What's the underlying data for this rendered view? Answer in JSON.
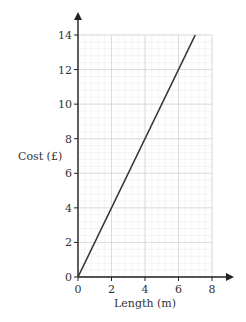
{
  "chart_data": {
    "type": "line",
    "title": "",
    "xlabel": "Length (m)",
    "ylabel": "Cost (£)",
    "xlim": [
      0,
      8
    ],
    "ylim": [
      0,
      14
    ],
    "x_ticks": [
      0,
      2,
      4,
      6,
      8
    ],
    "y_ticks": [
      0,
      2,
      4,
      6,
      8,
      10,
      12,
      14
    ],
    "grid": true,
    "minor_grid_step": 0.4,
    "legend": null,
    "series": [
      {
        "name": "Cost",
        "x": [
          0,
          7
        ],
        "y": [
          0,
          14
        ],
        "color": "#333333"
      }
    ]
  },
  "labels": {
    "xlabel": "Length (m)",
    "ylabel": "Cost (£)"
  }
}
